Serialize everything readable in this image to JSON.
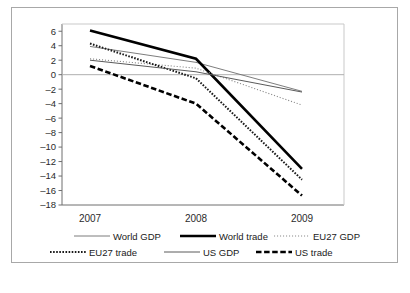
{
  "chart_data": {
    "type": "line",
    "title": "",
    "subtitle": "",
    "xlabel": "",
    "ylabel": "",
    "categories": [
      "2007",
      "2008",
      "2009"
    ],
    "x_tick_labels": [
      "2007",
      "2008",
      "2009"
    ],
    "y_tick_labels": [
      "6",
      "4",
      "2",
      "0",
      "–2",
      "–4",
      "–6",
      "–8",
      "–10",
      "–12",
      "–14",
      "–16",
      "–18"
    ],
    "y_ticks": [
      6,
      4,
      2,
      0,
      -2,
      -4,
      -6,
      -8,
      -10,
      -12,
      -14,
      -16,
      -18
    ],
    "ylim": [
      -18,
      7
    ],
    "grid": false,
    "zero_line": true,
    "legend_position": "bottom",
    "series": [
      {
        "name": "World GDP",
        "values": [
          3.9,
          1.7,
          -2.3
        ],
        "style": "solid-thin",
        "color": "#6e6e6e"
      },
      {
        "name": "World trade",
        "values": [
          6.1,
          2.2,
          -13.0
        ],
        "style": "solid-thick",
        "color": "#000000"
      },
      {
        "name": "EU27 GDP",
        "values": [
          2.2,
          0.9,
          -4.2
        ],
        "style": "dotted-fine",
        "color": "#8a8a8a"
      },
      {
        "name": "EU27 trade",
        "values": [
          4.3,
          -0.5,
          -14.5
        ],
        "style": "dotted-bold",
        "color": "#1a1a1a"
      },
      {
        "name": "US GDP",
        "values": [
          2.0,
          0.4,
          -2.4
        ],
        "style": "solid-medium",
        "color": "#5a5a5a"
      },
      {
        "name": "US trade",
        "values": [
          1.2,
          -4.0,
          -16.7
        ],
        "style": "dashed-thick",
        "color": "#000000"
      }
    ]
  },
  "legend": {
    "row1": [
      "World GDP",
      "World trade",
      "EU27 GDP"
    ],
    "row2": [
      "EU27 trade",
      "US GDP",
      "US trade"
    ]
  },
  "colors": {
    "frame": "#a8a8a8",
    "axis": "#6e6e6e",
    "zero_line": "#b0b0b0",
    "text": "#1a1a1a",
    "background": "#ffffff"
  }
}
